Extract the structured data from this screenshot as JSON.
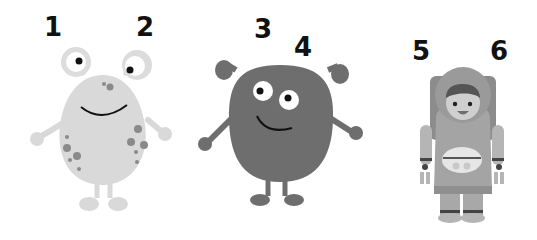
{
  "labels": {
    "l1": "1",
    "l2": "2",
    "l3": "3",
    "l4": "4",
    "l5": "5",
    "l6": "6"
  },
  "figures": [
    {
      "name": "light-gray spotted monster with eye stalks",
      "color": "#d9d9d9"
    },
    {
      "name": "dark-gray round monster with ear knobs",
      "color": "#6e6e6e"
    },
    {
      "name": "astronaut child in space suit",
      "color": "#a8a8a8"
    }
  ]
}
